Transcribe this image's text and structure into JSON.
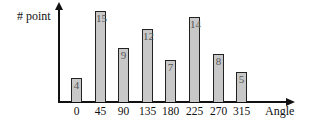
{
  "chart_data": {
    "type": "bar",
    "title": "",
    "xlabel": "Angle",
    "ylabel": "# point",
    "categories": [
      "0",
      "45",
      "90",
      "135",
      "180",
      "225",
      "270",
      "315"
    ],
    "values": [
      4,
      15,
      9,
      12,
      7,
      14,
      8,
      5
    ],
    "bar_color": "#c8c8c8",
    "edge_color": "#222222",
    "value_labels_inside_bars": true,
    "grid": false,
    "legend": null,
    "y_ticks_shown": false
  },
  "layout": {
    "bars": [
      {
        "category": "0",
        "value": 4,
        "left": 71,
        "top": 78
      },
      {
        "category": "45",
        "value": 15,
        "left": 95,
        "top": 11
      },
      {
        "category": "90",
        "value": 9,
        "left": 118,
        "top": 48
      },
      {
        "category": "135",
        "value": 12,
        "left": 142,
        "top": 29
      },
      {
        "category": "180",
        "value": 7,
        "left": 165,
        "top": 60
      },
      {
        "category": "225",
        "value": 14,
        "left": 189,
        "top": 17
      },
      {
        "category": "270",
        "value": 8,
        "left": 213,
        "top": 54
      },
      {
        "category": "315",
        "value": 5,
        "left": 236,
        "top": 72
      }
    ],
    "baseline": 102
  }
}
